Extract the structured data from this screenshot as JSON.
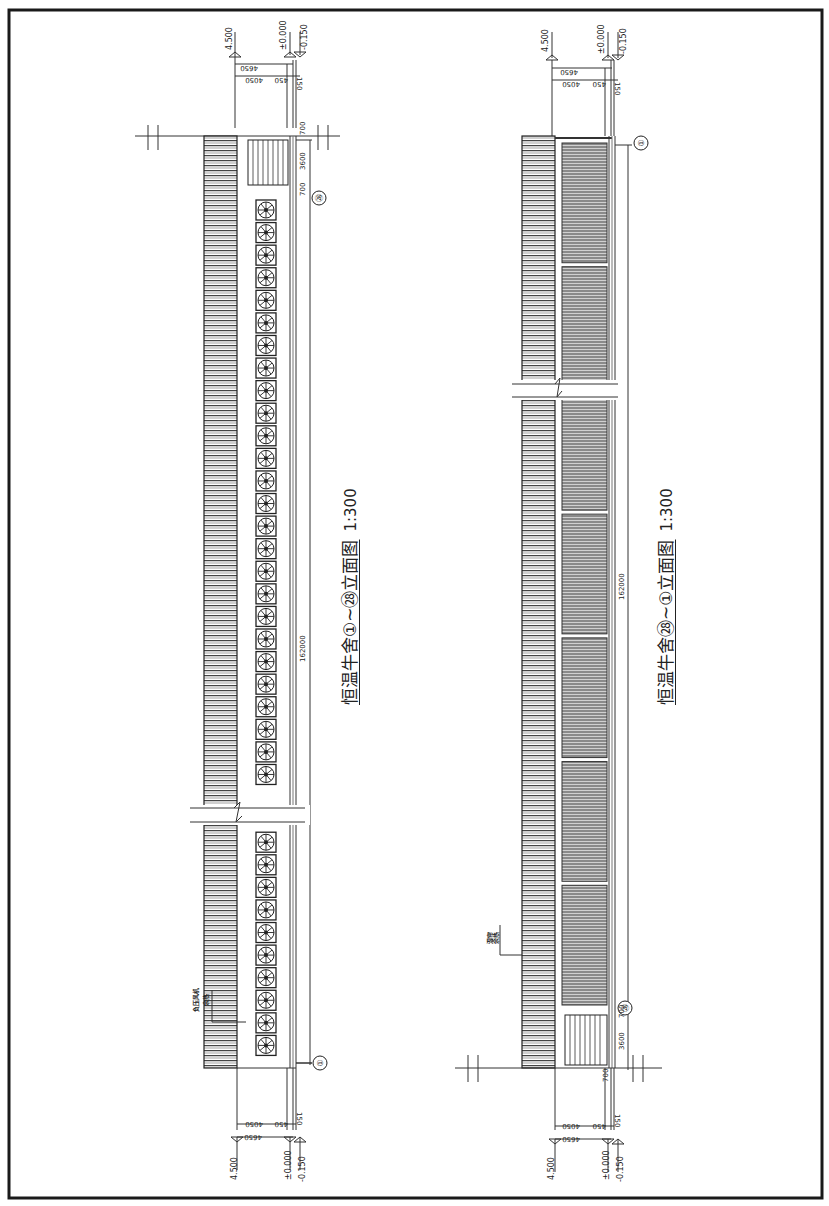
{
  "sheet": {
    "border_color": "#1a1a1a",
    "line_color": "#333333"
  },
  "elevations": [
    {
      "id": "elevation-1-28",
      "title": "恒温牛舍①~㉘立面图",
      "scale": "1:300",
      "overall_length": "162000",
      "levels": {
        "eave": "4.500",
        "floor": "±0.000",
        "ground": "-0.150"
      },
      "vertical_dims": {
        "total": "4650",
        "upper": "4050",
        "middle": "450",
        "base": "150"
      },
      "end_dims": {
        "top": "700",
        "door": "3600",
        "bottom": "700"
      },
      "axis_start": "①",
      "axis_end": "㉘",
      "annotation": {
        "line1": "负压风机",
        "line2": "余热"
      },
      "fan_count": 38
    },
    {
      "id": "elevation-28-1",
      "title": "恒温牛舍㉘~①立面图",
      "scale": "1:300",
      "overall_length": "162000",
      "levels": {
        "eave": "4.500",
        "floor": "±0.000",
        "ground": "-0.150"
      },
      "vertical_dims": {
        "total": "4650",
        "upper": "4050",
        "middle": "450",
        "base": "150"
      },
      "end_dims": {
        "top": "700",
        "door": "3600",
        "bottom": "700"
      },
      "axis_start": "㉘",
      "axis_end": "①",
      "annotation": {
        "line1": "湿帘",
        "line2": "余热"
      },
      "curtain_panels": 7
    }
  ]
}
